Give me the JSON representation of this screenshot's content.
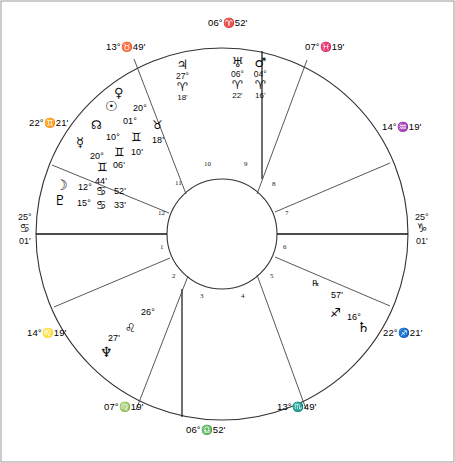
{
  "chart": {
    "type": "astrological-natal-wheel",
    "outer_radius_px": 186,
    "inner_radius_px": 55,
    "center": [
      222,
      234
    ]
  },
  "axes": {
    "ascendant": {
      "degree": "25°",
      "sign_glyph": "♋",
      "sign_name": "Cancer",
      "minute": "01'"
    },
    "descendant": {
      "degree": "25°",
      "sign_glyph": "♑",
      "sign_name": "Capricorn",
      "minute": "01'"
    }
  },
  "cusps": [
    {
      "id": "mc",
      "text": "06°♈52'",
      "degree": "06°",
      "sign_glyph": "♈",
      "sign_name": "Aries",
      "minute": "52'"
    },
    {
      "id": "c11",
      "text": "13°♉49'",
      "degree": "13°",
      "sign_glyph": "♉",
      "sign_name": "Taurus",
      "minute": "49'"
    },
    {
      "id": "c12",
      "text": "22°♊21'",
      "degree": "22°",
      "sign_glyph": "♊",
      "sign_name": "Gemini",
      "minute": "21'"
    },
    {
      "id": "c2",
      "text": "14°♌19'",
      "degree": "14°",
      "sign_glyph": "♌",
      "sign_name": "Leo",
      "minute": "19'"
    },
    {
      "id": "c3",
      "text": "07°♍19'",
      "degree": "07°",
      "sign_glyph": "♍",
      "sign_name": "Virgo",
      "minute": "19'"
    },
    {
      "id": "ic",
      "text": "06°♎52'",
      "degree": "06°",
      "sign_glyph": "♎",
      "sign_name": "Libra",
      "minute": "52'"
    },
    {
      "id": "c5",
      "text": "13°♏49'",
      "degree": "13°",
      "sign_glyph": "♏",
      "sign_name": "Scorpio",
      "minute": "49'"
    },
    {
      "id": "c6",
      "text": "22°♐21'",
      "degree": "22°",
      "sign_glyph": "♐",
      "sign_name": "Sagittarius",
      "minute": "21'"
    },
    {
      "id": "c8",
      "text": "14°♒19'",
      "degree": "14°",
      "sign_glyph": "♒",
      "sign_name": "Aquarius",
      "minute": "19'"
    },
    {
      "id": "c9",
      "text": "07°♓19'",
      "degree": "07°",
      "sign_glyph": "♓",
      "sign_name": "Pisces",
      "minute": "19'"
    }
  ],
  "planets": [
    {
      "id": "jupiter",
      "glyph": "♃",
      "name": "Jupiter",
      "degree": "27°",
      "sign_glyph": "♈",
      "sign_name": "Aries",
      "minute": "18'",
      "retrograde": false
    },
    {
      "id": "uranus",
      "glyph": "♅",
      "name": "Uranus",
      "degree": "06°",
      "sign_glyph": "♈",
      "sign_name": "Aries",
      "minute": "22'",
      "retrograde": false
    },
    {
      "id": "mars",
      "glyph": "♂",
      "name": "Mars",
      "degree": "04°",
      "sign_glyph": "♈",
      "sign_name": "Aries",
      "minute": "16'",
      "retrograde": false
    },
    {
      "id": "venus",
      "glyph": "♀",
      "name": "Venus",
      "degree": "20°",
      "sign_glyph": "♉",
      "sign_name": "Taurus",
      "minute": "18'",
      "retrograde": false
    },
    {
      "id": "sun",
      "glyph": "☉",
      "name": "Sun",
      "degree": "01°",
      "sign_glyph": "♊",
      "sign_name": "Gemini",
      "minute": "10'",
      "retrograde": false
    },
    {
      "id": "node",
      "glyph": "☊",
      "name": "North Node",
      "degree": "10°",
      "sign_glyph": "♊",
      "sign_name": "Gemini",
      "minute": "06'",
      "retrograde": false
    },
    {
      "id": "mercury",
      "glyph": "☿",
      "name": "Mercury",
      "degree": "20°",
      "sign_glyph": "♊",
      "sign_name": "Gemini",
      "minute": "44'",
      "retrograde": false
    },
    {
      "id": "moon",
      "glyph": "☽",
      "name": "Moon",
      "degree": "12°",
      "sign_glyph": "♋",
      "sign_name": "Cancer",
      "minute": "52'",
      "retrograde": false
    },
    {
      "id": "pluto",
      "glyph": "♇",
      "name": "Pluto",
      "degree": "15°",
      "sign_glyph": "♋",
      "sign_name": "Cancer",
      "minute": "33'",
      "retrograde": false
    },
    {
      "id": "neptune",
      "glyph": "♆",
      "name": "Neptune",
      "degree": "26°",
      "sign_glyph": "♌",
      "sign_name": "Leo",
      "minute": "27'",
      "retrograde": false
    },
    {
      "id": "saturn",
      "glyph": "♄",
      "name": "Saturn",
      "degree": "16°",
      "sign_glyph": "♐",
      "sign_name": "Sagittarius",
      "minute": "57'",
      "retrograde": true,
      "rx_mark": "℞"
    }
  ],
  "houses": {
    "numbers": [
      "1",
      "2",
      "3",
      "4",
      "5",
      "6",
      "7",
      "8",
      "9",
      "10",
      "11",
      "12"
    ]
  },
  "colors": {
    "line": "#3a3a3a",
    "border": "#8a8a8a",
    "text": "#000000",
    "background": "#ffffff"
  }
}
